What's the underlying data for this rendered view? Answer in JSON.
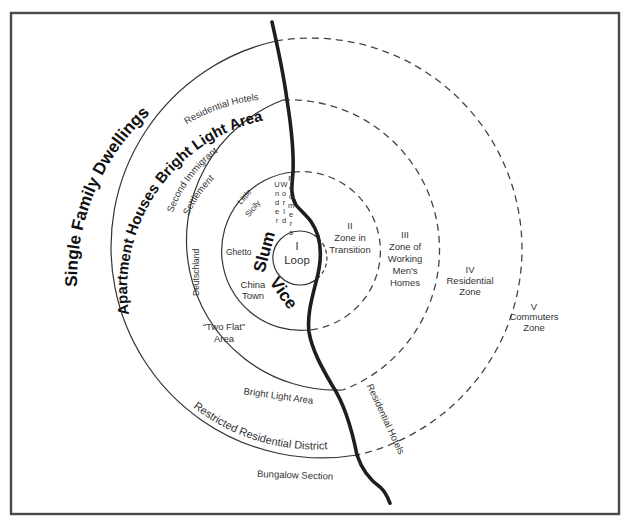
{
  "diagram": {
    "zones": [
      {
        "id": "I",
        "numeral": "I",
        "name": "Loop"
      },
      {
        "id": "II",
        "numeral": "II",
        "name_line1": "Zone in",
        "name_line2": "Transition"
      },
      {
        "id": "III",
        "numeral": "III",
        "name_line1": "Zone of",
        "name_line2": "Working",
        "name_line3": "Men's",
        "name_line4": "Homes"
      },
      {
        "id": "IV",
        "numeral": "IV",
        "name_line1": "Residential",
        "name_line2": "Zone"
      },
      {
        "id": "V",
        "numeral": "V",
        "name_line1": "Commuters",
        "name_line2": "Zone"
      }
    ],
    "labels": {
      "single_family": "Single Family Dwellings",
      "residential_hotels_top": "Residential Hotels",
      "apartment_houses": "Apartment Houses Bright Light Area",
      "second_immigrant_1": "Second Immigrant",
      "second_immigrant_2": "Settlement",
      "deutschland": "Deutschland",
      "little_sicily_1": "Little",
      "little_sicily_2": "Sicily",
      "under_world": [
        "U",
        "n",
        "d",
        "e",
        "r"
      ],
      "world": [
        "W",
        "o",
        "r",
        "l",
        "d"
      ],
      "roomers": [
        "R",
        "o",
        "o",
        "m",
        "e",
        "r",
        "s"
      ],
      "ghetto": "Ghetto",
      "slum": "Slum",
      "vice": "Vice",
      "china_town_1": "China",
      "china_town_2": "Town",
      "two_flat_1": "“Two Flat”",
      "two_flat_2": "Area",
      "bright_light_bottom": "Bright Light  Area",
      "restricted": "Restricted Residential District",
      "bungalow": "Bungalow Section",
      "residential_hotels_right": "Residential Hotels"
    },
    "colors": {
      "frame": "#4a4a4a",
      "lines": "#333333",
      "river": "#1e1e1e",
      "text": "#333333"
    }
  }
}
